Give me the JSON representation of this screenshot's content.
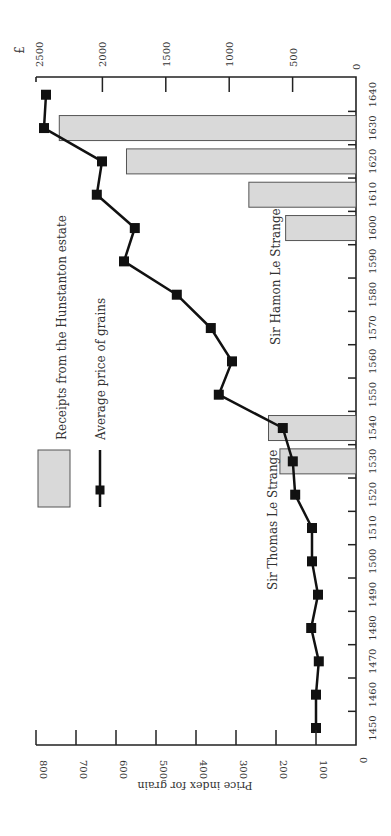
{
  "chart_data": {
    "type": "bar+line",
    "orientation": "rotated-90-clockwise",
    "x": [
      1450,
      1460,
      1470,
      1480,
      1490,
      1500,
      1510,
      1520,
      1530,
      1540,
      1550,
      1560,
      1570,
      1580,
      1590,
      1600,
      1610,
      1620,
      1630,
      1640
    ],
    "xlabel": "",
    "x_tick_labels": [
      "1450",
      "1460",
      "1470",
      "1480",
      "1490",
      "1500",
      "1510",
      "1520",
      "1530",
      "1540",
      "1550",
      "1560",
      "1570",
      "1580",
      "1590",
      "1600",
      "1610",
      "1620",
      "1630",
      "1640"
    ],
    "series": [
      {
        "name": "Average price of grains",
        "type": "line",
        "axis": "left",
        "values": [
          100,
          100,
          93,
          112,
          95,
          110,
          110,
          152,
          158,
          183,
          343,
          310,
          363,
          448,
          580,
          553,
          648,
          635,
          780,
          775
        ]
      },
      {
        "name": "Receipts from the Hunstanton estate",
        "type": "bar",
        "axis": "right",
        "x": [
          1530,
          1540,
          1600,
          1610,
          1620,
          1630
        ],
        "values": [
          600,
          690,
          555,
          845,
          1810,
          2340
        ]
      }
    ],
    "ylabel": "Price index for grain",
    "ylim": [
      0,
      800
    ],
    "y_ticks": [
      "0",
      "100",
      "200",
      "300",
      "400",
      "500",
      "600",
      "700",
      "800"
    ],
    "y2label": "£",
    "y2lim": [
      0,
      2500
    ],
    "y2_ticks": [
      "0",
      "500",
      "1000",
      "1500",
      "2000",
      "2500"
    ],
    "legend": {
      "bar_label": "Receipts from the Hunstanton estate",
      "line_label": "Average price of grains"
    },
    "annotations": [
      {
        "text": "Sir Thomas Le Strange",
        "year": 1510
      },
      {
        "text": "Sir Hamon Le Strange",
        "year": 1575
      }
    ],
    "grid": false,
    "colors": {
      "bar_fill": "#d9d9d9",
      "bar_stroke": "#555555",
      "line": "#111111",
      "axis": "#222222"
    }
  }
}
